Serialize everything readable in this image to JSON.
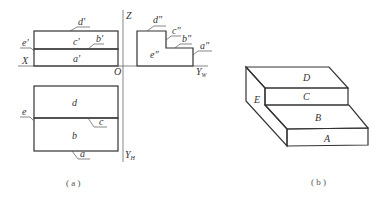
{
  "figure_a": {
    "caption": "( a )",
    "axes": {
      "z": "Z",
      "x": "X",
      "origin": "O",
      "y_w": "Y",
      "y_w_sub": "W",
      "y_h": "Y",
      "y_h_sub": "H"
    },
    "front_view": {
      "labels": {
        "d": "d'",
        "c": "c'",
        "b": "b'",
        "a": "a'",
        "e": "e'"
      }
    },
    "side_view": {
      "labels": {
        "d": "d\"",
        "c": "c\"",
        "b": "b\"",
        "a": "a\"",
        "e": "e\""
      }
    },
    "top_view": {
      "labels": {
        "d": "d",
        "c": "c",
        "b": "b",
        "a": "a",
        "e": "e"
      }
    }
  },
  "figure_b": {
    "caption": "( b )",
    "faces": {
      "d": "D",
      "c": "C",
      "b": "B",
      "a": "A",
      "e": "E"
    }
  },
  "colors": {
    "face_d": "#8e8e8e",
    "face_c": "#9c9c9c",
    "face_b_top": "#c4c4c4",
    "face_b_bottom": "#e6e6e6",
    "face_a": "#f6f6f6",
    "face_e_top": "#9a9a9a",
    "face_e_bottom": "#dcdcdc",
    "edge": "#333333"
  }
}
